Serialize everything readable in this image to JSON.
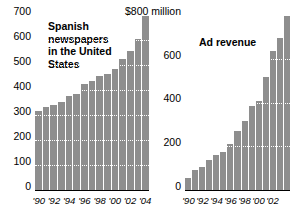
{
  "chart_data": [
    {
      "id": "spanish-newspapers",
      "type": "bar",
      "title": "Spanish\nnewspapers\nin the United\nStates",
      "xlabel": "",
      "ylabel": "",
      "ylim": [
        0,
        700
      ],
      "grid": true,
      "legend": "none",
      "categories": [
        "1990",
        "1991",
        "1992",
        "1993",
        "1994",
        "1995",
        "1996",
        "1997",
        "1998",
        "1999",
        "2000",
        "2001",
        "2002",
        "2003",
        "2004"
      ],
      "values": [
        320,
        335,
        345,
        355,
        380,
        390,
        430,
        440,
        460,
        470,
        490,
        530,
        560,
        610,
        700
      ],
      "ytick_labels": [
        "700",
        "600",
        "500",
        "400",
        "300",
        "200",
        "100",
        "0"
      ],
      "ytick_values": [
        700,
        600,
        500,
        400,
        300,
        200,
        100,
        0
      ],
      "xtick_labels": [
        "'90",
        "'92",
        "'94",
        "'96",
        "'98",
        "'00",
        "'02",
        "'04"
      ],
      "xtick_indices": [
        0,
        2,
        4,
        6,
        8,
        10,
        12,
        14
      ],
      "bar_color": "#8e8e8e"
    },
    {
      "id": "ad-revenue",
      "type": "bar",
      "title": "Ad revenue",
      "xlabel": "",
      "ylabel": "",
      "ylim": [
        0,
        800
      ],
      "grid": true,
      "legend": "none",
      "categories": [
        "1990",
        "1991",
        "1992",
        "1993",
        "1994",
        "1995",
        "1996",
        "1997",
        "1998",
        "1999",
        "2000",
        "2001",
        "2002",
        "2003"
      ],
      "values": [
        60,
        95,
        110,
        140,
        165,
        180,
        215,
        275,
        320,
        390,
        410,
        520,
        640,
        700,
        800
      ],
      "ytick_labels": [
        "$800 million",
        "600",
        "400",
        "200",
        "0"
      ],
      "ytick_values": [
        800,
        600,
        400,
        200,
        0
      ],
      "xtick_labels": [
        "'90",
        "'92",
        "'94",
        "'96",
        "'98",
        "'00",
        "'02"
      ],
      "xtick_indices": [
        0,
        2,
        4,
        6,
        8,
        10,
        12
      ],
      "bar_color": "#8e8e8e"
    }
  ]
}
